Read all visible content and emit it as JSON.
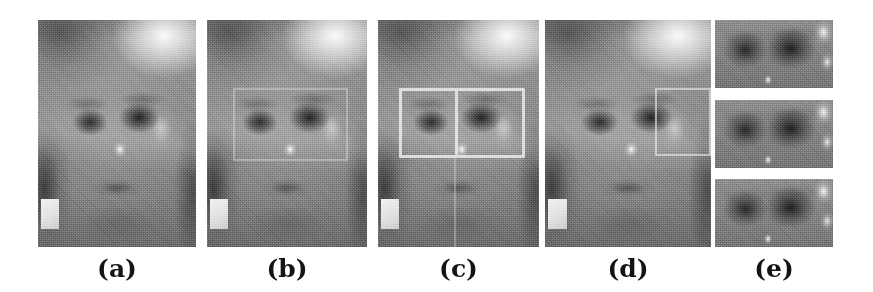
{
  "figure": {
    "type": "image-panel-figure",
    "background_color": "#ffffff",
    "panel_count": 5,
    "captions": {
      "a": "(a)",
      "b": "(b)",
      "c": "(c)",
      "d": "(d)",
      "e": "(e)"
    },
    "panels": [
      {
        "id": "a",
        "caption": "(a)",
        "content": "grayscale face photograph",
        "overlays": []
      },
      {
        "id": "b",
        "caption": "(b)",
        "content": "grayscale face photograph",
        "overlays": [
          "faint region-of-interest rectangle over both eyes"
        ]
      },
      {
        "id": "c",
        "caption": "(c)",
        "content": "grayscale face photograph",
        "overlays": [
          "bright region-of-interest rectangle over both eyes",
          "vertical divider splitting the rectangle in two halves"
        ]
      },
      {
        "id": "d",
        "caption": "(d)",
        "content": "grayscale face photograph",
        "overlays": [
          "region-of-interest rectangle over the right eye only"
        ]
      },
      {
        "id": "e",
        "caption": "(e)",
        "content": "three stacked cropped eye-region images",
        "overlays": [],
        "crops": [
          "eye-crop-top",
          "eye-crop-middle",
          "eye-crop-bottom"
        ]
      }
    ],
    "colors": {
      "page_background": "#ffffff",
      "caption_text": "#141414",
      "image_midtone": "#8a8a8a",
      "overlay_box": "#f0f0f0"
    }
  }
}
